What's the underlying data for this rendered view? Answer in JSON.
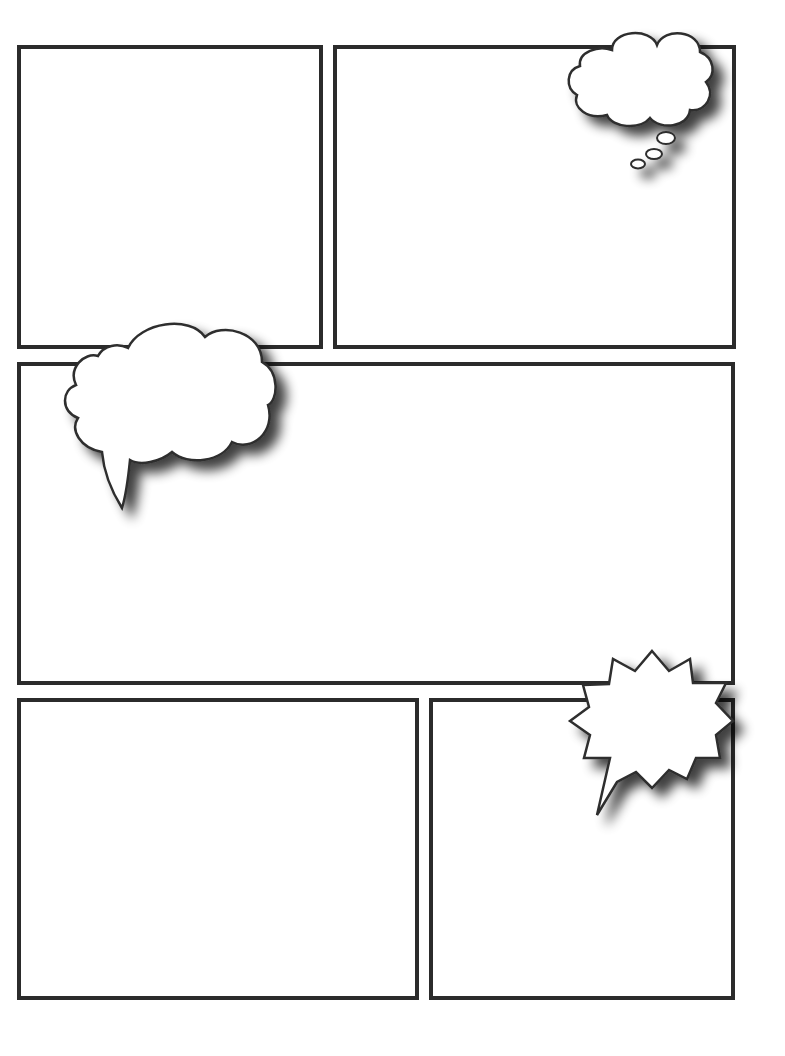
{
  "page": {
    "type": "comic-page-template",
    "background": "#ffffff",
    "border_color": "#2b2b2b"
  },
  "panels": [
    {
      "id": "panel-1",
      "label": "",
      "x": 17,
      "y": 45,
      "w": 306,
      "h": 304
    },
    {
      "id": "panel-2",
      "label": "",
      "x": 333,
      "y": 45,
      "w": 403,
      "h": 304
    },
    {
      "id": "panel-3",
      "label": "",
      "x": 17,
      "y": 362,
      "w": 718,
      "h": 323
    },
    {
      "id": "panel-4",
      "label": "",
      "x": 17,
      "y": 698,
      "w": 402,
      "h": 302
    },
    {
      "id": "panel-5",
      "label": "",
      "x": 429,
      "y": 698,
      "w": 306,
      "h": 302
    }
  ],
  "balloons": [
    {
      "id": "thought-bubble",
      "type": "thought",
      "text": ""
    },
    {
      "id": "speech-cloud",
      "type": "speech",
      "text": ""
    },
    {
      "id": "shout-burst",
      "type": "exclamation",
      "text": ""
    }
  ]
}
